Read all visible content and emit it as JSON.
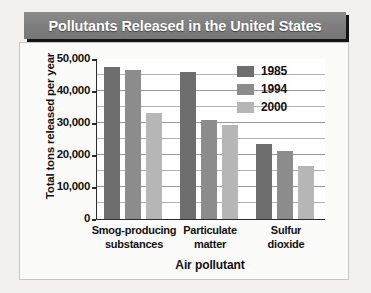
{
  "title": "Pollutants Released in the United States",
  "chart_data": {
    "type": "bar",
    "title": "Pollutants Released in the United States",
    "xlabel": "Air pollutant",
    "ylabel": "Total tons released per year",
    "ylim": [
      0,
      50000
    ],
    "ytick_labels": [
      "0",
      "10,000",
      "20,000",
      "30,000",
      "40,000",
      "50,000"
    ],
    "ytick_values": [
      0,
      10000,
      20000,
      30000,
      40000,
      50000
    ],
    "minor_gridline_step": 5000,
    "grid": true,
    "legend_position": "top-right",
    "categories": [
      "Smog-producing substances",
      "Particulate matter",
      "Sulfur dioxide"
    ],
    "category_lines": [
      [
        "Smog-producing",
        "substances"
      ],
      [
        "Particulate",
        "matter"
      ],
      [
        "Sulfur",
        "dioxide"
      ]
    ],
    "series": [
      {
        "name": "1985",
        "color": "#6e6e6e",
        "values": [
          47500,
          45800,
          23500
        ]
      },
      {
        "name": "1994",
        "color": "#8c8c8c",
        "values": [
          46500,
          30900,
          21200
        ]
      },
      {
        "name": "2000",
        "color": "#b6b6b6",
        "values": [
          33000,
          29500,
          16500
        ]
      }
    ]
  },
  "colors": {
    "title_bar": "#7d7d7d",
    "title_text": "#ffffff",
    "plot_background": "#ffffff",
    "gridline": "#b4b2ae",
    "axis": "#2b2b2b",
    "page_background": "#f2f1ef"
  }
}
